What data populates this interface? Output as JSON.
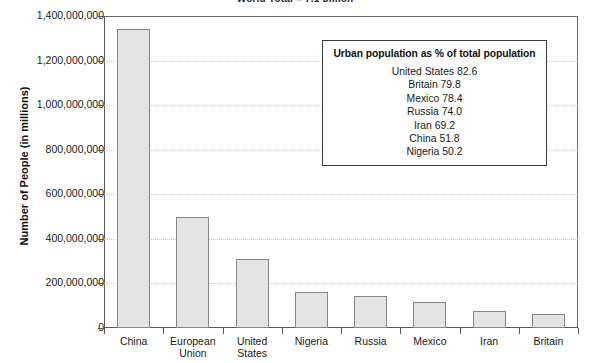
{
  "chart_data": {
    "type": "bar",
    "title": "World Total = 7.1 billion",
    "xlabel": "",
    "ylabel": "Number of People (in millions)",
    "ylim": [
      0,
      1400000000
    ],
    "grid": true,
    "categories": [
      "China",
      "European Union",
      "United States",
      "Nigeria",
      "Russia",
      "Mexico",
      "Iran",
      "Britain"
    ],
    "values": [
      1340000000,
      500000000,
      310000000,
      160000000,
      142000000,
      115000000,
      78000000,
      63000000
    ],
    "ytick_labels": [
      "1,400,000,000",
      "1,200,000,000",
      "1,000,000,000",
      "800,000,000",
      "600,000,000",
      "400,000,000",
      "200,000,000",
      "0"
    ],
    "ytick_values": [
      1400000000,
      1200000000,
      1000000000,
      800000000,
      600000000,
      400000000,
      200000000,
      0
    ],
    "legend_position": "inside-top-right",
    "annotation": {
      "title": "Urban population as % of total population",
      "rows": [
        "United States 82.6",
        "Britain 79.8",
        "Mexico 78.4",
        "Russia 74.0",
        "Iran 69.2",
        "China 51.8",
        "Nigeria 50.2"
      ]
    },
    "colors": {
      "bar_fill": "#e3e3e3",
      "bar_border": "#868688",
      "axis": "#59595b",
      "grid": "#c9c9c9",
      "text": "#1b1b1b",
      "legend_border": "#3d3d3f"
    }
  },
  "xlabels": [
    {
      "line1": "China",
      "line2": ""
    },
    {
      "line1": "European",
      "line2": "Union"
    },
    {
      "line1": "United",
      "line2": "States"
    },
    {
      "line1": "Nigeria",
      "line2": ""
    },
    {
      "line1": "Russia",
      "line2": ""
    },
    {
      "line1": "Mexico",
      "line2": ""
    },
    {
      "line1": "Iran",
      "line2": ""
    },
    {
      "line1": "Britain",
      "line2": ""
    }
  ]
}
